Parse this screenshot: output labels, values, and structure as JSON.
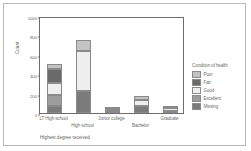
{
  "chart_data": {
    "type": "bar",
    "subtype": "stacked-bar",
    "title": "",
    "xlabel": "Highest degree received",
    "ylabel": "Count",
    "ylim": [
      0,
      1000
    ],
    "yticks": [
      0,
      200,
      400,
      600,
      800,
      1000
    ],
    "ytick_labels": [
      "0",
      "200",
      "400",
      "600",
      "800",
      "1000"
    ],
    "grid": false,
    "legend_title": "Condition of health",
    "legend_position": "right",
    "categories": [
      "LT High school",
      "High school",
      "Junior college",
      "Bachelor",
      "Graduate"
    ],
    "series": [
      {
        "name": "Missing",
        "color": "#7b7b7b",
        "values": [
          70,
          230,
          8,
          75,
          25
        ]
      },
      {
        "name": "Excellent",
        "color": "#9d9d9d",
        "values": [
          120,
          0,
          0,
          0,
          0
        ]
      },
      {
        "name": "Good",
        "color": "#eeeeee",
        "values": [
          120,
          405,
          22,
          55,
          30
        ]
      },
      {
        "name": "Fair",
        "color": "#6a6a6a",
        "values": [
          140,
          0,
          0,
          0,
          0
        ]
      },
      {
        "name": "Poor",
        "color": "#c3c3c3",
        "values": [
          55,
          120,
          10,
          45,
          15
        ]
      }
    ],
    "stack_order_bottom_to_top": [
      "Missing",
      "Excellent",
      "Good",
      "Fair",
      "Poor"
    ],
    "totals": [
      505,
      755,
      40,
      175,
      70
    ]
  },
  "legend": {
    "title": "Condition of health",
    "items": [
      {
        "label": "Poor",
        "color": "#c3c3c3"
      },
      {
        "label": "Fair",
        "color": "#6a6a6a"
      },
      {
        "label": "Good",
        "color": "#eeeeee"
      },
      {
        "label": "Excellent",
        "color": "#9d9d9d"
      },
      {
        "label": "Missing",
        "color": "#7b7b7b"
      }
    ]
  },
  "axes": {
    "y_title": "Count",
    "x_title": "Highest degree received",
    "y_ticks": [
      "1000",
      "800",
      "600",
      "400",
      "200",
      "0"
    ],
    "x_labels": [
      "LT High school",
      "High school",
      "Junior college",
      "Bachelor",
      "Graduate"
    ]
  }
}
